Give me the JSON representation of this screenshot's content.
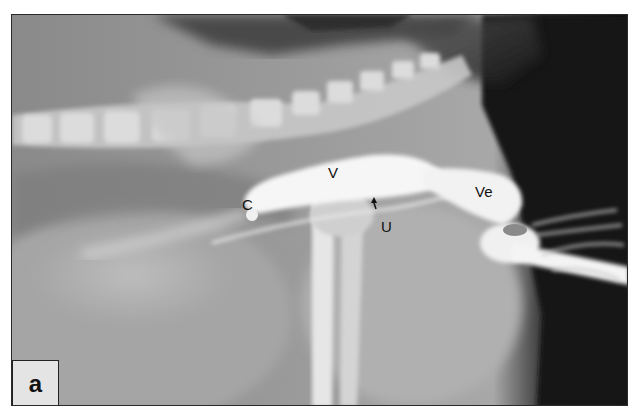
{
  "figure": {
    "type": "radiograph",
    "panel_label": "a",
    "annotations": [
      {
        "id": "C",
        "text": "C",
        "x": 241,
        "y": 197
      },
      {
        "id": "V",
        "text": "V",
        "x": 327,
        "y": 164
      },
      {
        "id": "U",
        "text": "U",
        "x": 380,
        "y": 218
      },
      {
        "id": "Ve",
        "text": "Ve",
        "x": 474,
        "y": 183
      }
    ],
    "arrow": {
      "target": "U",
      "x": 373,
      "y": 200
    }
  }
}
